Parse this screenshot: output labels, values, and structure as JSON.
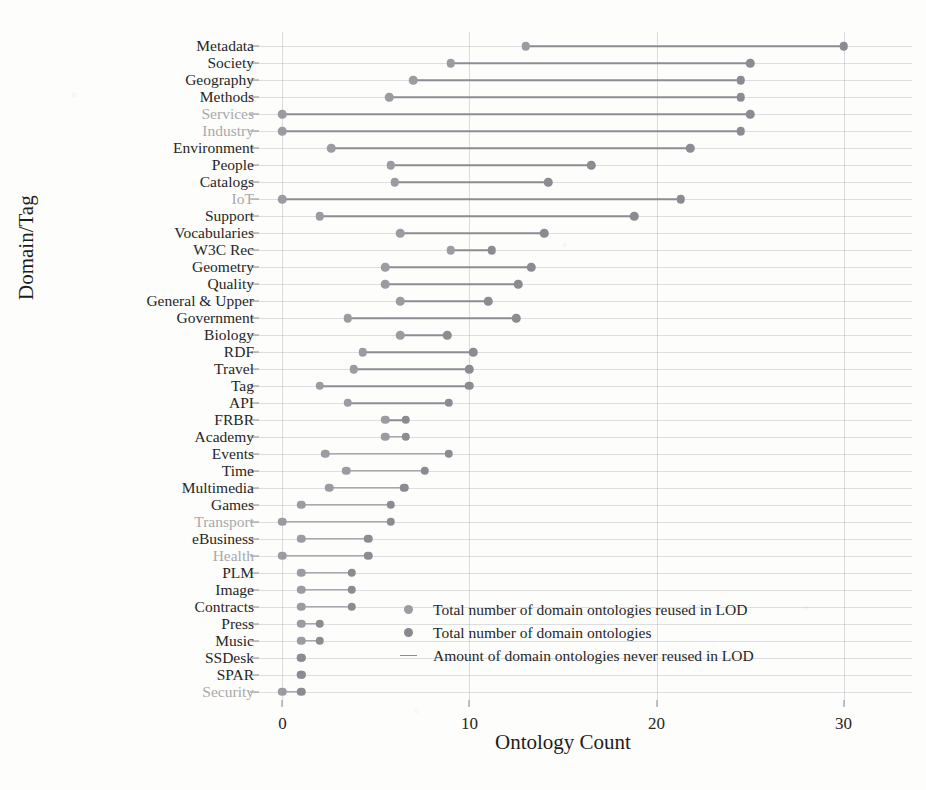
{
  "chart_data": {
    "type": "scatter",
    "title": "",
    "xlabel": "Ontology Count",
    "ylabel": "Domain/Tag",
    "xlim": [
      -1.2,
      31.2
    ],
    "xticks": [
      0,
      10,
      20,
      30
    ],
    "grid": true,
    "legend_position": "inside-lower-right",
    "series": [
      {
        "name": "Total number of domain ontologies reused in LOD",
        "key": "reused",
        "color": "#9a9ca2",
        "marker": "circle"
      },
      {
        "name": "Total number of domain ontologies",
        "key": "total",
        "color": "#87898f",
        "marker": "circle"
      },
      {
        "name": "Amount of domain ontologies never reused in LOD",
        "key": "never",
        "color": "#8b8d93",
        "marker": "line"
      }
    ],
    "categories": [
      {
        "label": "Metadata",
        "reused": 13,
        "total": 30,
        "faded": false
      },
      {
        "label": "Society",
        "reused": 9,
        "total": 25,
        "faded": false
      },
      {
        "label": "Geography",
        "reused": 7,
        "total": 24.5,
        "faded": false
      },
      {
        "label": "Methods",
        "reused": 5.7,
        "total": 24.5,
        "faded": false
      },
      {
        "label": "Services",
        "reused": 0,
        "total": 25,
        "faded": true
      },
      {
        "label": "Industry",
        "reused": 0,
        "total": 24.5,
        "faded": true
      },
      {
        "label": "Environment",
        "reused": 2.6,
        "total": 21.8,
        "faded": false
      },
      {
        "label": "People",
        "reused": 5.8,
        "total": 16.5,
        "faded": false
      },
      {
        "label": "Catalogs",
        "reused": 6,
        "total": 14.2,
        "faded": false
      },
      {
        "label": "IoT",
        "reused": 0,
        "total": 21.3,
        "faded": true
      },
      {
        "label": "Support",
        "reused": 2,
        "total": 18.8,
        "faded": false
      },
      {
        "label": "Vocabularies",
        "reused": 6.3,
        "total": 14,
        "faded": false
      },
      {
        "label": "W3C Rec",
        "reused": 9,
        "total": 11.2,
        "faded": false
      },
      {
        "label": "Geometry",
        "reused": 5.5,
        "total": 13.3,
        "faded": false
      },
      {
        "label": "Quality",
        "reused": 5.5,
        "total": 12.6,
        "faded": false
      },
      {
        "label": "General & Upper",
        "reused": 6.3,
        "total": 11,
        "faded": false
      },
      {
        "label": "Government",
        "reused": 3.5,
        "total": 12.5,
        "faded": false
      },
      {
        "label": "Biology",
        "reused": 6.3,
        "total": 8.8,
        "faded": false
      },
      {
        "label": "RDF",
        "reused": 4.3,
        "total": 10.2,
        "faded": false
      },
      {
        "label": "Travel",
        "reused": 3.8,
        "total": 10,
        "faded": false
      },
      {
        "label": "Tag",
        "reused": 2,
        "total": 10,
        "faded": false
      },
      {
        "label": "API",
        "reused": 3.5,
        "total": 8.9,
        "faded": false
      },
      {
        "label": "FRBR",
        "reused": 5.5,
        "total": 6.6,
        "faded": false
      },
      {
        "label": "Academy",
        "reused": 5.5,
        "total": 6.6,
        "faded": false
      },
      {
        "label": "Events",
        "reused": 2.3,
        "total": 8.9,
        "faded": false
      },
      {
        "label": "Time",
        "reused": 3.4,
        "total": 7.6,
        "faded": false
      },
      {
        "label": "Multimedia",
        "reused": 2.5,
        "total": 6.5,
        "faded": false
      },
      {
        "label": "Games",
        "reused": 1,
        "total": 5.8,
        "faded": false
      },
      {
        "label": "Transport",
        "reused": 0,
        "total": 5.8,
        "faded": true
      },
      {
        "label": "eBusiness",
        "reused": 1,
        "total": 4.6,
        "faded": false
      },
      {
        "label": "Health",
        "reused": 0,
        "total": 4.6,
        "faded": true
      },
      {
        "label": "PLM",
        "reused": 1,
        "total": 3.7,
        "faded": false
      },
      {
        "label": "Image",
        "reused": 1,
        "total": 3.7,
        "faded": false
      },
      {
        "label": "Contracts",
        "reused": 1,
        "total": 3.7,
        "faded": false
      },
      {
        "label": "Press",
        "reused": 1,
        "total": 2,
        "faded": false
      },
      {
        "label": "Music",
        "reused": 1,
        "total": 2,
        "faded": false
      },
      {
        "label": "SSDesk",
        "reused": 1,
        "total": 1,
        "faded": false
      },
      {
        "label": "SPAR",
        "reused": 1,
        "total": 1,
        "faded": false
      },
      {
        "label": "Security",
        "reused": 0,
        "total": 1,
        "faded": true
      }
    ]
  }
}
